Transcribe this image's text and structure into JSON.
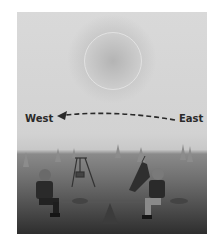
{
  "figure": {
    "labels": {
      "west": "West",
      "east": "East"
    },
    "arrow": {
      "direction": "east-to-west",
      "style": "dashed"
    },
    "elements": [
      "sun",
      "dashed-arrow",
      "trees",
      "swing-set",
      "slide",
      "seesaw",
      "child-left",
      "child-right"
    ],
    "colors": {
      "sky": "#d6d6d6",
      "ground": "#5a5a5a",
      "text": "#2a2a2a"
    }
  }
}
